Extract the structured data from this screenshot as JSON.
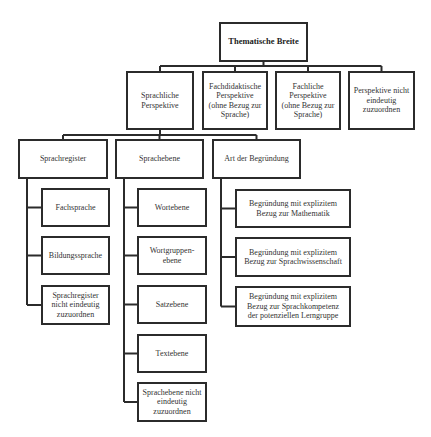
{
  "diagram": {
    "title": "Thematische Breite",
    "colors": {
      "line": "#2b2b2b",
      "text": "#333333",
      "background": "#ffffff"
    },
    "nodes": [
      {
        "id": "root",
        "label": "Thematische Breite",
        "x": 219,
        "y": 22,
        "w": 89,
        "h": 40
      },
      {
        "id": "sprachliche",
        "label": "Sprachliche\nPerspektive",
        "x": 126,
        "y": 71,
        "w": 68,
        "h": 59
      },
      {
        "id": "fachdidaktische",
        "label": "Fachdidaktische\nPerspektive\n(ohne Bezug zur\nSprache)",
        "x": 202,
        "y": 71,
        "w": 66,
        "h": 59
      },
      {
        "id": "fachliche",
        "label": "Fachliche\nPerspektive\n(ohne Bezug zur\nSprache)",
        "x": 275,
        "y": 71,
        "w": 66,
        "h": 59
      },
      {
        "id": "perspektive-nicht",
        "label": "Perspektive nicht\neindeutig\nzuzuordnen",
        "x": 348,
        "y": 71,
        "w": 67,
        "h": 59
      },
      {
        "id": "sprachregister",
        "label": "Sprachregister",
        "x": 18,
        "y": 139,
        "w": 90,
        "h": 40
      },
      {
        "id": "sprachebene",
        "label": "Sprachebene",
        "x": 115,
        "y": 139,
        "w": 89,
        "h": 40
      },
      {
        "id": "art-begruendung",
        "label": "Art der Begründung",
        "x": 212,
        "y": 139,
        "w": 89,
        "h": 40
      },
      {
        "id": "fachsprache",
        "label": "Fachsprache",
        "x": 41,
        "y": 188,
        "w": 69,
        "h": 39
      },
      {
        "id": "bildungssprache",
        "label": "Bildungssprache",
        "x": 41,
        "y": 236,
        "w": 69,
        "h": 39
      },
      {
        "id": "sprachregister-nicht",
        "label": "Sprachregister\nnicht eindeutig\nzuzuordnen",
        "x": 41,
        "y": 285,
        "w": 69,
        "h": 40
      },
      {
        "id": "wortebene",
        "label": "Wortebene",
        "x": 137,
        "y": 188,
        "w": 70,
        "h": 39
      },
      {
        "id": "wortgruppenebene",
        "label": "Wortgruppen-\nebene",
        "x": 137,
        "y": 236,
        "w": 70,
        "h": 39
      },
      {
        "id": "satzebene",
        "label": "Satzebene",
        "x": 137,
        "y": 285,
        "w": 70,
        "h": 39
      },
      {
        "id": "textebene",
        "label": "Textebene",
        "x": 137,
        "y": 334,
        "w": 70,
        "h": 39
      },
      {
        "id": "sprachebene-nicht",
        "label": "Sprachebene nicht\neindeutig\nzuzuordnen",
        "x": 137,
        "y": 382,
        "w": 70,
        "h": 40
      },
      {
        "id": "begruendung-mathematik",
        "label": "Begründung mit explizitem\nBezug zur Mathematik",
        "x": 235,
        "y": 189,
        "w": 116,
        "h": 39
      },
      {
        "id": "begruendung-sprachwissenschaft",
        "label": "Begründung mit explizitem\nBezug zur Sprachwissenschaft",
        "x": 235,
        "y": 237,
        "w": 116,
        "h": 40
      },
      {
        "id": "begruendung-sprachkompetenz",
        "label": "Begründung mit explizitem\nBezug zur Sprachkompetenz\nder potenziellen Lerngruppe",
        "x": 235,
        "y": 286,
        "w": 116,
        "h": 41
      }
    ],
    "edges": [
      {
        "from": "root",
        "to": "sprachliche"
      },
      {
        "from": "root",
        "to": "fachdidaktische"
      },
      {
        "from": "root",
        "to": "fachliche"
      },
      {
        "from": "root",
        "to": "perspektive-nicht"
      },
      {
        "from": "sprachliche",
        "to": "sprachregister"
      },
      {
        "from": "sprachliche",
        "to": "sprachebene"
      },
      {
        "from": "sprachliche",
        "to": "art-begruendung"
      },
      {
        "from": "sprachregister",
        "to": "fachsprache"
      },
      {
        "from": "sprachregister",
        "to": "bildungssprache"
      },
      {
        "from": "sprachregister",
        "to": "sprachregister-nicht"
      },
      {
        "from": "sprachebene",
        "to": "wortebene"
      },
      {
        "from": "sprachebene",
        "to": "wortgruppenebene"
      },
      {
        "from": "sprachebene",
        "to": "satzebene"
      },
      {
        "from": "sprachebene",
        "to": "textebene"
      },
      {
        "from": "sprachebene",
        "to": "sprachebene-nicht"
      },
      {
        "from": "art-begruendung",
        "to": "begruendung-mathematik"
      },
      {
        "from": "art-begruendung",
        "to": "begruendung-sprachwissenschaft"
      },
      {
        "from": "art-begruendung",
        "to": "begruendung-sprachkompetenz"
      }
    ],
    "connectors": {
      "root_bus_y": 66,
      "level2_bus_y": 135,
      "trunks": [
        {
          "parent": "sprachregister",
          "x": 27
        },
        {
          "parent": "sprachebene",
          "x": 124
        },
        {
          "parent": "art-begruendung",
          "x": 221
        }
      ]
    }
  }
}
